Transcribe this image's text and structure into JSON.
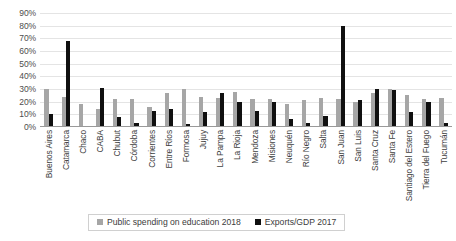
{
  "chart_data": {
    "type": "bar",
    "title": "",
    "xlabel": "",
    "ylabel": "",
    "ylim": [
      0,
      90
    ],
    "grid": true,
    "legend_position": "bottom",
    "y_ticks": [
      "0%",
      "10%",
      "20%",
      "30%",
      "40%",
      "50%",
      "60%",
      "70%",
      "80%",
      "90%"
    ],
    "y_tick_values": [
      0,
      10,
      20,
      30,
      40,
      50,
      60,
      70,
      80,
      90
    ],
    "categories": [
      "Buenos Aires",
      "Catamarca",
      "Chaco",
      "CABA",
      "Chubut",
      "Córdoba",
      "Corrientes",
      "Entre Ríos",
      "Formosa",
      "Jujuy",
      "La Pampa",
      "La Rioja",
      "Mendoza",
      "Misiones",
      "Neuquén",
      "Río Negro",
      "Salta",
      "San Juan",
      "San Luis",
      "Santa Cruz",
      "Santa Fe",
      "Santiago del Estero",
      "Tierra del Fuego",
      "Tucumán"
    ],
    "series": [
      {
        "name": "Public spending on education 2018",
        "color": "#a6a6a6",
        "values": [
          30,
          24,
          18,
          14,
          22,
          22,
          16,
          27,
          30,
          24,
          23,
          28,
          22,
          22,
          18,
          21,
          23,
          22,
          20,
          27,
          30,
          25,
          22,
          23
        ]
      },
      {
        "name": "Exports/GDP 2017",
        "color": "#101010",
        "values": [
          10,
          68,
          0,
          31,
          8,
          3,
          13,
          14,
          2,
          12,
          27,
          20,
          13,
          20,
          6,
          3,
          9,
          80,
          21,
          30,
          29,
          12,
          20,
          3
        ]
      }
    ]
  },
  "legend": {
    "items": [
      {
        "label": "Public spending on education 2018",
        "color": "#a6a6a6"
      },
      {
        "label": "Exports/GDP 2017",
        "color": "#101010"
      }
    ]
  }
}
